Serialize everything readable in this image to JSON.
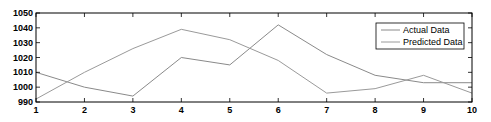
{
  "chart_data": {
    "type": "line",
    "title": "",
    "xlabel": "",
    "ylabel": "",
    "x": [
      1,
      2,
      3,
      4,
      5,
      6,
      7,
      8,
      9,
      10
    ],
    "xlim": [
      1,
      10
    ],
    "ylim": [
      990,
      1050
    ],
    "yticks": [
      990,
      1000,
      1010,
      1020,
      1030,
      1040,
      1050
    ],
    "xticks": [
      1,
      2,
      3,
      4,
      5,
      6,
      7,
      8,
      9,
      10
    ],
    "grid": false,
    "legend_position": "upper right",
    "series": [
      {
        "name": "Actual Data",
        "color": "#8a8a8a",
        "values": [
          1010,
          1000,
          994,
          1020,
          1015,
          1042,
          1022,
          1008,
          1003,
          1003
        ]
      },
      {
        "name": "Predicted Data",
        "color": "#9a9a9a",
        "values": [
          992,
          1010,
          1026,
          1039,
          1032,
          1018,
          996,
          999,
          1008,
          996
        ]
      }
    ]
  },
  "legend": {
    "items": [
      "Actual Data",
      "Predicted Data"
    ]
  }
}
